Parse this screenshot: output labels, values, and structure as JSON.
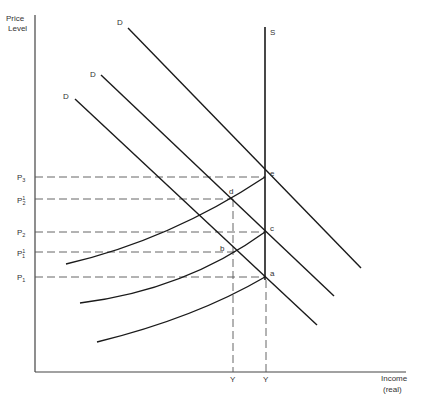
{
  "axes": {
    "y_label_line1": "Price",
    "y_label_line2": "Level",
    "x_label_line1": "Income",
    "x_label_line2": "(real)"
  },
  "supply": {
    "label": "S"
  },
  "demand": [
    {
      "label": "D",
      "id": "D1"
    },
    {
      "label": "D",
      "id": "D2"
    },
    {
      "label": "D",
      "id": "D3"
    }
  ],
  "price_levels": [
    {
      "base": "P",
      "sub": "3",
      "sup": ""
    },
    {
      "base": "P",
      "sub": "2",
      "sup": "1"
    },
    {
      "base": "P",
      "sub": "2",
      "sup": ""
    },
    {
      "base": "P",
      "sub": "1",
      "sup": "1"
    },
    {
      "base": "P",
      "sub": "1",
      "sup": ""
    }
  ],
  "points": {
    "a": "a",
    "b": "b",
    "c": "c",
    "d": "d",
    "e": "e"
  },
  "income_ticks": [
    {
      "label": "Y"
    },
    {
      "label": "Y"
    }
  ],
  "colors": {
    "line": "#1a1a1a",
    "dash": "#555555",
    "text": "#333333"
  }
}
